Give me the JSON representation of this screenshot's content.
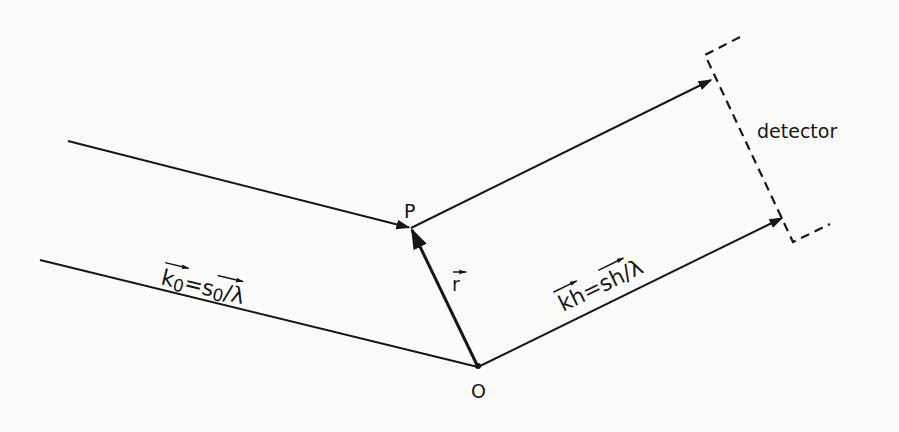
{
  "diagram": {
    "type": "x-ray diffraction path-difference schematic",
    "colors": {
      "ink": "#161616",
      "background": "#fbfbfa"
    },
    "points": {
      "P": {
        "label": "P",
        "x": 411,
        "y": 228
      },
      "O": {
        "label": "O",
        "x": 478,
        "y": 367
      }
    },
    "labels": {
      "incident_vector": {
        "lhs": "k",
        "lhs_sub": "0",
        "eq": "=",
        "rhs": "s",
        "rhs_sub": "0",
        "div": "/λ"
      },
      "diffracted_vector": {
        "lhs": "k",
        "lhs_sub": "h",
        "eq": "=",
        "rhs": "s",
        "rhs_sub": "h",
        "div": "/λ"
      },
      "position_vector": "r",
      "detector": "detector"
    },
    "lines": [
      {
        "name": "incident-ray-upper",
        "from": [
          68,
          141
        ],
        "to": [
          411,
          228
        ],
        "arrow": true
      },
      {
        "name": "incident-ray-lower",
        "from": [
          40,
          260
        ],
        "to": [
          478,
          367
        ],
        "arrow": false
      },
      {
        "name": "position-vector-r",
        "from": [
          478,
          367
        ],
        "to": [
          411,
          228
        ],
        "arrow": true
      },
      {
        "name": "diffracted-ray-upper",
        "from": [
          411,
          228
        ],
        "to": [
          712,
          80
        ],
        "arrow": true
      },
      {
        "name": "diffracted-ray-lower",
        "from": [
          478,
          367
        ],
        "to": [
          783,
          218
        ],
        "arrow": true
      }
    ],
    "detector_outline": [
      [
        740,
        37
      ],
      [
        705,
        55
      ],
      [
        793,
        242
      ],
      [
        830,
        224
      ]
    ]
  }
}
